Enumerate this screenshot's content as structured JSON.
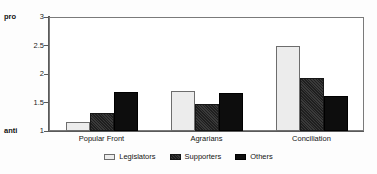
{
  "chart_data": {
    "type": "bar",
    "title": "",
    "xlabel": "",
    "ylabel": "",
    "ylim": [
      1,
      3
    ],
    "yticks": [
      "1",
      "1.5",
      "2",
      "2.5",
      "3"
    ],
    "ytick_values": [
      1,
      1.5,
      2,
      2.5,
      3
    ],
    "grid": false,
    "legend_position": "bottom-center",
    "axis_endpoint_labels": {
      "low": "anti",
      "high": "pro"
    },
    "categories": [
      "Popular Front",
      "Agrarians",
      "Conciliation"
    ],
    "series": [
      {
        "name": "Legislators",
        "color": "#ececec",
        "values": [
          1.15,
          1.7,
          2.5
        ]
      },
      {
        "name": "Supporters",
        "color": "#2a2a2a",
        "values": [
          1.31,
          1.47,
          1.93
        ]
      },
      {
        "name": "Others",
        "color": "#0d0d0d",
        "values": [
          1.69,
          1.66,
          1.62
        ]
      }
    ]
  }
}
